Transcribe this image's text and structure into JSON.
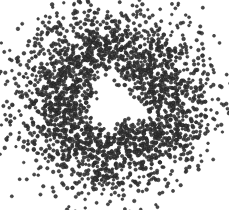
{
  "figure": {
    "caption": "",
    "width": 229,
    "height": 210,
    "background_color": "#ffffff"
  },
  "chart_data": {
    "type": "scatter",
    "title": "",
    "subtitle": "",
    "xlabel": "",
    "ylabel": "",
    "grid": false,
    "legend": null,
    "axes_visible": false,
    "tick_labels_x": [],
    "tick_labels_y": [],
    "xlim": [
      -1.35,
      1.35
    ],
    "ylim": [
      -1.35,
      1.35
    ],
    "marker": {
      "shape": "circle",
      "color": "#3a3a3a",
      "edge_color": "#1e1e1e",
      "size_px": 3.1,
      "opacity": 0.92
    },
    "n_points": 2600,
    "distribution": {
      "family": "annulus",
      "center_x_px": 113,
      "center_y_px": 102,
      "radius_mean_px": 62,
      "radius_sigma_px": 26,
      "inner_hole_radius_px": 22,
      "hole_offset_x_px": 2,
      "hole_offset_y_px": 2,
      "x_scale": 1.0,
      "y_scale": 0.94,
      "random_seed": 20240517
    },
    "series": [
      {
        "name": "points",
        "color": "#3a3a3a",
        "marker": "o"
      }
    ]
  }
}
